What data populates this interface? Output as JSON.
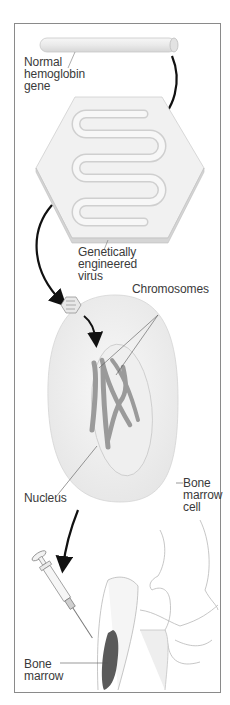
{
  "diagram": {
    "type": "gene-therapy-process",
    "steps": [
      {
        "id": "gene",
        "label_lines": [
          "Normal",
          "hemoglobin",
          "gene"
        ]
      },
      {
        "id": "virus",
        "label_lines": [
          "Genetically",
          "engineered",
          "virus"
        ]
      },
      {
        "id": "chromosomes",
        "label_lines": [
          "Chromosomes"
        ]
      },
      {
        "id": "nucleus",
        "label_lines": [
          "Nucleus"
        ]
      },
      {
        "id": "cell",
        "label_lines": [
          "Bone",
          "marrow",
          "cell"
        ]
      },
      {
        "id": "marrow",
        "label_lines": [
          "Bone",
          "marrow"
        ]
      }
    ],
    "colors": {
      "border": "#8a8a8a",
      "arrow": "#111111",
      "fill_light": "#f0f0f0",
      "chromosome": "#9a9a9a",
      "marrow": "#5a5a5a",
      "text": "#3a3a3a"
    }
  }
}
